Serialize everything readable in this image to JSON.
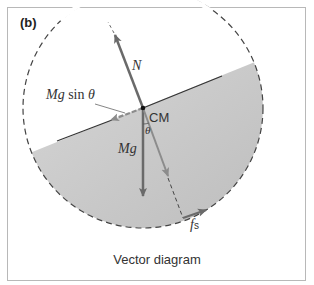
{
  "panel": {
    "label": "(b)"
  },
  "labels": {
    "normal_force": "N",
    "mg_sin_theta_italic": "Mg",
    "mg_sin_theta_func": " sin ",
    "mg_sin_theta_theta": "θ",
    "center_of_mass": "CM",
    "weight": "Mg",
    "angle": "θ",
    "friction_f": "f",
    "friction_sub": "s"
  },
  "caption": "Vector diagram",
  "colors": {
    "fill": "#c8c8c8",
    "arrow_dark": "#6a6a6a",
    "arrow_light": "#8c8c8c",
    "outline": "#444444",
    "frame": "#b8b8b8"
  }
}
